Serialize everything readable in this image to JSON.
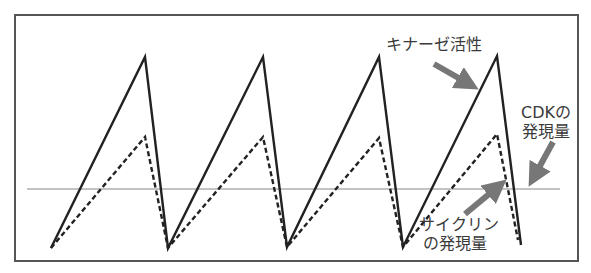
{
  "diagram": {
    "frame": {
      "x": 15,
      "y": 15,
      "width": 563,
      "height": 246,
      "color": "#555555"
    },
    "threshold_line": {
      "x1": 27,
      "x2": 560,
      "y": 189,
      "color": "#888888",
      "label": "CDKの発現量"
    },
    "series": [
      {
        "name": "キナーゼ活性",
        "style": "solid",
        "color": "#222222",
        "points": [
          [
            51,
            248
          ],
          [
            145,
            57
          ],
          [
            168,
            248
          ],
          [
            263,
            57
          ],
          [
            287,
            247
          ],
          [
            379,
            57
          ],
          [
            403,
            247
          ],
          [
            497,
            56
          ],
          [
            521,
            245
          ]
        ]
      },
      {
        "name": "サイクリンの発現量",
        "style": "dashed",
        "color": "#222222",
        "points": [
          [
            51,
            248
          ],
          [
            145,
            137
          ],
          [
            168,
            248
          ],
          [
            263,
            137
          ],
          [
            287,
            247
          ],
          [
            379,
            138
          ],
          [
            403,
            247
          ],
          [
            497,
            134
          ],
          [
            518,
            240
          ]
        ]
      }
    ],
    "arrows": [
      {
        "name": "kinase-arrow",
        "from": [
          434,
          64
        ],
        "to": [
          478,
          89
        ]
      },
      {
        "name": "cdk-arrow",
        "from": [
          553,
          142
        ],
        "to": [
          529,
          186
        ]
      },
      {
        "name": "cyclin-arrow",
        "from": [
          465,
          214
        ],
        "to": [
          506,
          180
        ]
      }
    ],
    "arrow_color": "#777777"
  },
  "labels": {
    "kinase_activity": "キナーゼ活性",
    "cdk_line1": "CDKの",
    "cdk_line2": "発現量",
    "cyclin_line1": "サイクリン",
    "cyclin_line2": "の発現量"
  }
}
